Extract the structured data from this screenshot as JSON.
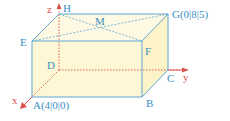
{
  "diagram": {
    "colors": {
      "edge": "#5fa8d3",
      "face_fill": "#fdf7d6",
      "axis": "#d9534f",
      "label": "#3a8fc4",
      "hidden_edge": "#d9534f"
    },
    "axes": {
      "x": "x",
      "y": "y",
      "z": "z"
    },
    "points": {
      "A": "A(4|0|0)",
      "B": "B",
      "C": "C",
      "D": "D",
      "E": "E",
      "F": "F",
      "G": "G(0|8|5)",
      "H": "H",
      "M": "M"
    }
  }
}
